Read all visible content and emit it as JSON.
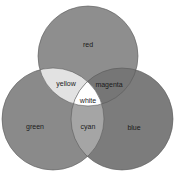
{
  "diagram": {
    "type": "venn",
    "sets": [
      {
        "id": "red",
        "label": "red",
        "cx": 88,
        "cy": 56,
        "r": 50,
        "fill": "#8e8e8e",
        "label_x": 88,
        "label_y": 45
      },
      {
        "id": "green",
        "label": "green",
        "cx": 53,
        "cy": 119,
        "r": 51,
        "fill": "#8a8a8a",
        "label_x": 35,
        "label_y": 127
      },
      {
        "id": "blue",
        "label": "blue",
        "cx": 122,
        "cy": 119,
        "r": 51,
        "fill": "#7c7c7c",
        "label_x": 134,
        "label_y": 128
      }
    ],
    "intersections": [
      {
        "id": "yellow",
        "label": "yellow",
        "sets": [
          "red",
          "green"
        ],
        "fill": "#e2e2e2",
        "label_x": 66,
        "label_y": 84
      },
      {
        "id": "magenta",
        "label": "magenta",
        "sets": [
          "red",
          "blue"
        ],
        "fill": "#767676",
        "label_x": 109,
        "label_y": 85
      },
      {
        "id": "cyan",
        "label": "cyan",
        "sets": [
          "green",
          "blue"
        ],
        "fill": "#a5a5a5",
        "label_x": 88,
        "label_y": 127
      },
      {
        "id": "white",
        "label": "white",
        "sets": [
          "red",
          "green",
          "blue"
        ],
        "fill": "#ffffff",
        "label_x": 88,
        "label_y": 101
      }
    ]
  }
}
